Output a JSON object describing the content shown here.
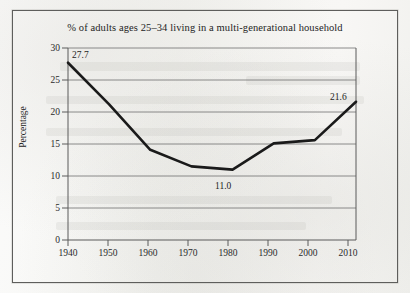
{
  "figure": {
    "title": "% of adults ages 25–34 living in a multi-generational household",
    "ylabel": "Percentage"
  },
  "axis": {
    "y_ticks": [
      "0",
      "5",
      "10",
      "15",
      "20",
      "25",
      "30"
    ],
    "x_ticks": [
      "1940",
      "1950",
      "1960",
      "1970",
      "1980",
      "1990",
      "2000",
      "2010"
    ]
  },
  "annotations": {
    "start": "27.7",
    "minimum": "11.0",
    "end": "21.6"
  },
  "colors": {
    "line": "#1a1a1a",
    "grid": "#6f6f6f",
    "axis": "#5a5a5a",
    "paper": "#f7f7f5",
    "frame": "#5e5e5c"
  },
  "chart_data": {
    "type": "line",
    "title": "% of adults ages 25–34 living in a multi-generational household",
    "xlabel": "",
    "ylabel": "Percentage",
    "x": [
      1940,
      1950,
      1960,
      1970,
      1980,
      1990,
      2000,
      2010
    ],
    "values": [
      27.7,
      21.2,
      14.1,
      11.5,
      11.0,
      15.1,
      15.6,
      21.6
    ],
    "categories": [
      "1940",
      "1950",
      "1960",
      "1970",
      "1980",
      "1990",
      "2000",
      "2010"
    ],
    "series": [
      {
        "name": "% of adults ages 25–34 living in a multi-generational household",
        "values": [
          27.7,
          21.2,
          14.1,
          11.5,
          11.0,
          15.1,
          15.6,
          21.6
        ]
      }
    ],
    "data_labels": [
      {
        "x": 1940,
        "y": 27.7,
        "text": "27.7"
      },
      {
        "x": 1980,
        "y": 11.0,
        "text": "11.0"
      },
      {
        "x": 2010,
        "y": 21.6,
        "text": "21.6"
      }
    ],
    "ylim": [
      0,
      30
    ],
    "xlim": [
      1940,
      2010
    ],
    "ytick_step": 5,
    "xtick_step": 10,
    "grid": "horizontal",
    "legend": "none"
  }
}
